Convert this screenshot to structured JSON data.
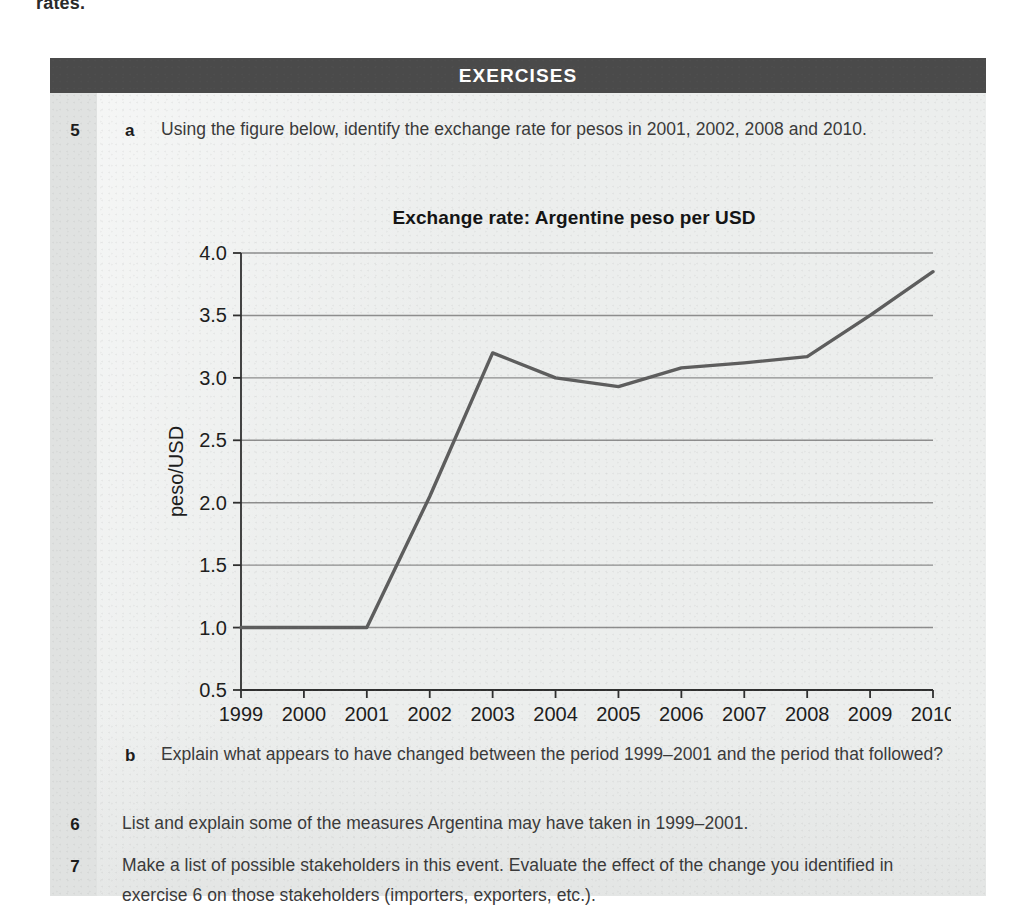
{
  "page": {
    "running_text_cutoff": "rates."
  },
  "panel": {
    "header_title": "EXERCISES",
    "header_bg": "#4a4a4a",
    "header_fg": "#ffffff",
    "body_bg": "#eceeed",
    "gutter_bg": "#e0e2e1"
  },
  "exercises": [
    {
      "number": "5",
      "letter": "a",
      "text": "Using the figure below, identify the exchange rate for pesos in 2001, 2002, 2008 and 2010."
    },
    {
      "number": "",
      "letter": "b",
      "text": "Explain what appears to have changed between the period 1999–2001 and the period that followed?"
    },
    {
      "number": "6",
      "letter": "",
      "text": "List and explain some of the measures Argentina may have taken in 1999–2001."
    },
    {
      "number": "7",
      "letter": "",
      "text": "Make a list of possible stakeholders in this event. Evaluate the effect of the change you identified in exercise 6 on those stakeholders (importers, exporters, etc.)."
    }
  ],
  "chart_data": {
    "type": "line",
    "title": "Exchange rate: Argentine peso per USD",
    "xlabel": "",
    "ylabel": "peso/USD",
    "categories": [
      "1999",
      "2000",
      "2001",
      "2002",
      "2003",
      "2004",
      "2005",
      "2006",
      "2007",
      "2008",
      "2009",
      "2010"
    ],
    "values": [
      1.0,
      1.0,
      1.0,
      2.05,
      3.2,
      3.0,
      2.93,
      3.08,
      3.12,
      3.17,
      3.5,
      3.85
    ],
    "series": [
      {
        "name": "peso/USD",
        "values": [
          1.0,
          1.0,
          1.0,
          2.05,
          3.2,
          3.0,
          2.93,
          3.08,
          3.12,
          3.17,
          3.5,
          3.85
        ]
      }
    ],
    "ylim": [
      0.5,
      4.0
    ],
    "ytick_values": [
      0.5,
      1.0,
      1.5,
      2.0,
      2.5,
      3.0,
      3.5,
      4.0
    ],
    "ytick_labels": [
      "0.5",
      "1.0",
      "1.5",
      "2.0",
      "2.5",
      "3.0",
      "3.5",
      "4.0"
    ],
    "xtick_labels": [
      "1999",
      "2000",
      "2001",
      "2002",
      "2003",
      "2004",
      "2005",
      "2006",
      "2007",
      "2008",
      "2009",
      "2010"
    ],
    "grid": true,
    "grid_axis": "y",
    "legend": false,
    "line_color": "#5d5d5d",
    "grid_color": "#8d8d8d",
    "axis_color": "#2f2f2f"
  }
}
